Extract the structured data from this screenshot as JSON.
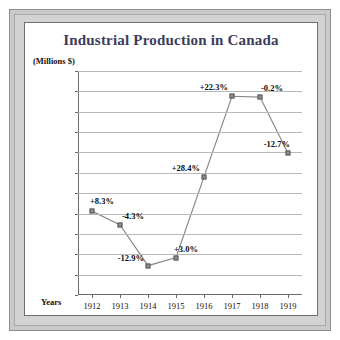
{
  "chart_data": {
    "type": "line",
    "title": "Industrial Production in Canada",
    "unit_label": "(Millions $)",
    "xlabel": "Years",
    "ylabel": "",
    "categories": [
      "1912",
      "1913",
      "1914",
      "1915",
      "1916",
      "1917",
      "1918",
      "1919"
    ],
    "values": [
      403000,
      386000,
      336000,
      346000,
      445000,
      544000,
      543000,
      474000
    ],
    "point_labels": [
      "+8.3%",
      "-4.3%",
      "-12.9%",
      "+3.0%",
      "+28.4%",
      "+22.3%",
      "-0.2%",
      "-12.7%"
    ],
    "ylim": [
      300000,
      575000
    ],
    "ytick_step": 25000,
    "ytick_labels": [
      "575 000",
      "550 000",
      "525 000",
      "500 000",
      "475 000",
      "450 000",
      "425 000",
      "400 000",
      "375 000",
      "350 000",
      "325 000",
      "300 000"
    ],
    "grid": true,
    "legend": "none",
    "series_color": "#8c8c8c",
    "line_color": "#8a8a8a",
    "title_color": "#3c3c5c",
    "grid_color": "#b9b9b9"
  }
}
